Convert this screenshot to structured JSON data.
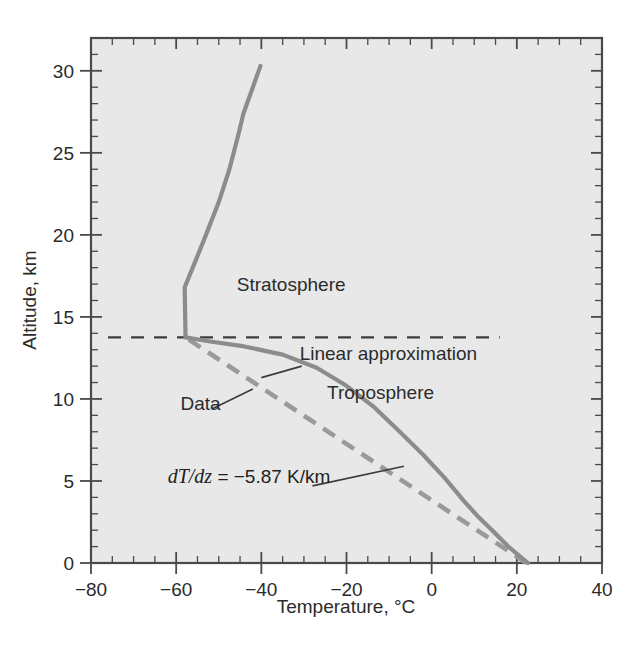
{
  "chart_data": {
    "type": "line",
    "title": "",
    "xlabel": "Temperature, °C",
    "ylabel": "Altitude, km",
    "xlim": [
      -80,
      40
    ],
    "ylim": [
      0,
      32
    ],
    "xticks": [
      -80,
      -60,
      -40,
      -20,
      0,
      20,
      40
    ],
    "xticklabels": [
      "−80",
      "−60",
      "−40",
      "−20",
      "0",
      "20",
      "40"
    ],
    "yticks": [
      0,
      5,
      10,
      15,
      20,
      25,
      30
    ],
    "yticklabels": [
      "0",
      "5",
      "10",
      "15",
      "20",
      "25",
      "30"
    ],
    "x_minor_step": 5,
    "y_minor_step": 1,
    "grid": false,
    "legend_position": "inline-annotations",
    "plot_background": "#e8e8e8",
    "series": [
      {
        "name": "Data",
        "style": "solid",
        "color": "#8c8c8c",
        "x_label": "Temperature, °C",
        "y_label": "Altitude, km",
        "points": [
          [
            22.6,
            0.0
          ],
          [
            18.0,
            1.0
          ],
          [
            14.2,
            2.0
          ],
          [
            11.0,
            2.8
          ],
          [
            7.5,
            3.8
          ],
          [
            3.0,
            5.2
          ],
          [
            -2.0,
            6.6
          ],
          [
            -7.5,
            8.0
          ],
          [
            -13.5,
            9.5
          ],
          [
            -20.0,
            10.8
          ],
          [
            -27.0,
            11.9
          ],
          [
            -35.0,
            12.7
          ],
          [
            -44.0,
            13.2
          ],
          [
            -52.0,
            13.5
          ],
          [
            -57.8,
            13.75
          ],
          [
            -58.0,
            16.8
          ],
          [
            -55.8,
            18.2
          ],
          [
            -53.0,
            20.0
          ],
          [
            -50.0,
            22.0
          ],
          [
            -47.5,
            24.0
          ],
          [
            -45.5,
            26.0
          ],
          [
            -44.2,
            27.4
          ],
          [
            -40.2,
            30.3
          ]
        ]
      },
      {
        "name": "Linear approximation",
        "style": "dashed",
        "color": "#9a9a9a",
        "points": [
          [
            22.3,
            0.0
          ],
          [
            -57.8,
            13.75
          ]
        ]
      }
    ],
    "reference_lines": [
      {
        "name": "tropopause",
        "orientation": "horizontal",
        "value": 13.75,
        "style": "dashed",
        "color": "#3c3c3c",
        "x_from": -76,
        "x_to": 16
      }
    ],
    "annotations": [
      {
        "name": "stratosphere",
        "text": "Stratosphere",
        "x": -33,
        "y": 16.6
      },
      {
        "name": "troposphere",
        "text": "Troposphere",
        "x": -12,
        "y": 10.0
      },
      {
        "name": "linear-approximation",
        "text": "Linear approximation",
        "x": -31,
        "y": 12.4,
        "leader_from": [
          -30.5,
          12.0
        ],
        "leader_to": [
          -40.0,
          11.3
        ]
      },
      {
        "name": "data",
        "text": "Data",
        "x": -59,
        "y": 9.3,
        "leader_from": [
          -51.5,
          9.4
        ],
        "leader_to": [
          -42.0,
          10.6
        ]
      },
      {
        "name": "lapse-rate",
        "text_math": "dT/dz",
        "text_rest": " = −5.87  K/km",
        "x": -62,
        "y": 4.9,
        "leader_from": [
          -28.0,
          4.7
        ],
        "leader_to": [
          -6.5,
          5.9
        ]
      }
    ]
  },
  "axes": {
    "x_title": "Temperature, °C",
    "y_title": "Altitude, km"
  },
  "labels": {
    "stratosphere": "Stratosphere",
    "troposphere": "Troposphere",
    "linear_approximation": "Linear approximation",
    "data": "Data",
    "lapse_math": "dT/dz",
    "lapse_rest": " = −5.87  K/km"
  },
  "xticklabels": {
    "t0": "−80",
    "t1": "−60",
    "t2": "−40",
    "t3": "−20",
    "t4": "0",
    "t5": "20",
    "t6": "40"
  },
  "yticklabels": {
    "t0": "0",
    "t1": "5",
    "t2": "10",
    "t3": "15",
    "t4": "20",
    "t5": "25",
    "t6": "30"
  },
  "colors": {
    "plot_background": "#e8e8e8",
    "frame": "#4a4a4a",
    "data_line": "#8c8c8c",
    "linear_line": "#9a9a9a",
    "tropopause_line": "#3c3c3c",
    "text": "#2b2b2b"
  }
}
